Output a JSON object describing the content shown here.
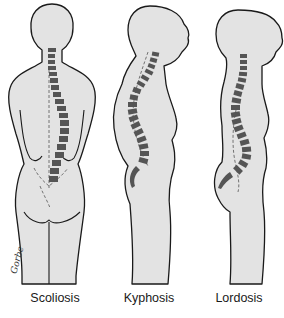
{
  "figure": {
    "colors": {
      "body_fill": "#e3e3e3",
      "outline": "#1a1a1a",
      "vertebrae": "#555555",
      "background": "#ffffff"
    },
    "panels": [
      {
        "label": "Scoliosis",
        "view": "posterior"
      },
      {
        "label": "Kyphosis",
        "view": "lateral"
      },
      {
        "label": "Lordosis",
        "view": "lateral"
      }
    ],
    "signature": "Gorbe"
  }
}
